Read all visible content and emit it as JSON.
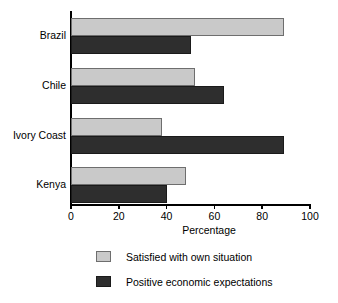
{
  "chart_data": {
    "type": "bar",
    "orientation": "horizontal",
    "title": "",
    "subtitle": "",
    "xlabel": "Percentage",
    "ylabel": "",
    "xlim": [
      0,
      100
    ],
    "xticks": [
      0,
      20,
      40,
      60,
      80,
      100
    ],
    "xtick_labels": [
      "0",
      "20",
      "40",
      "60",
      "80",
      "100"
    ],
    "grid": false,
    "legend_position": "bottom",
    "categories": [
      "Brazil",
      "Chile",
      "Ivory Coast",
      "Kenya"
    ],
    "series": [
      {
        "name": "Satisfied with own situation",
        "color": "#c9c9c9",
        "values": [
          89,
          52,
          38,
          48
        ]
      },
      {
        "name": "Positive economic expectations",
        "color": "#2e2e2e",
        "values": [
          50,
          64,
          89,
          40
        ]
      }
    ]
  },
  "legend": {
    "items": [
      {
        "label": "Satisfied with own situation",
        "swatch": "light"
      },
      {
        "label": "Positive economic expectations",
        "swatch": "dark"
      }
    ]
  },
  "colors": {
    "series_light": "#c9c9c9",
    "series_dark": "#2e2e2e",
    "axis": "#000000",
    "background": "#ffffff"
  }
}
